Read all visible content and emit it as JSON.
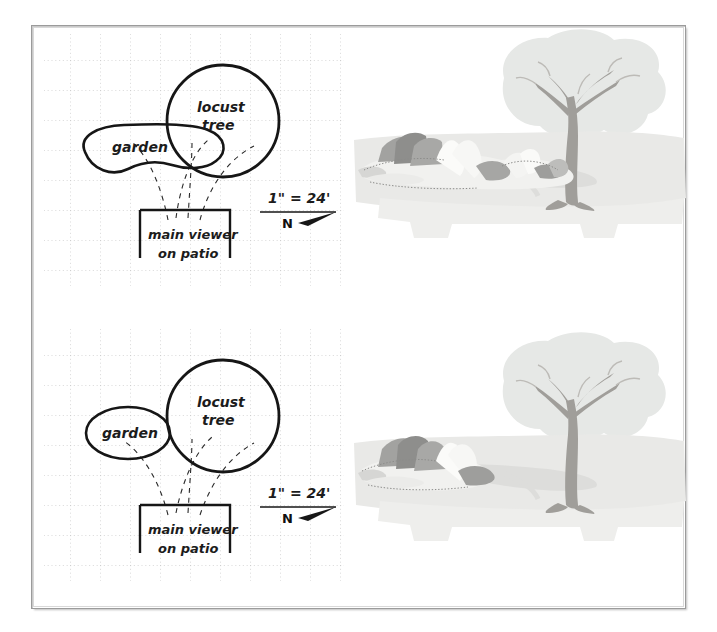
{
  "document": {
    "type": "landscape-design-study-sheet",
    "frame_color": "#9b9b9b",
    "paper_color": "#ffffff"
  },
  "studies": [
    {
      "id": "study-top",
      "variant": "large-garden",
      "plan": {
        "grid": {
          "style": "dotted",
          "color": "#b9b9b9",
          "spacing_px": 30
        },
        "shapes": [
          {
            "name": "garden-bed",
            "label": "garden",
            "kind": "freeform-blob",
            "size": "large"
          },
          {
            "name": "locust-tree-canopy",
            "label": "locust tree",
            "kind": "circle",
            "size": "large"
          },
          {
            "name": "viewer-patio",
            "label_line_1": "main viewer",
            "label_line_2": "on patio",
            "kind": "open-rectangle"
          }
        ],
        "sightlines": {
          "name": "view-cone",
          "style": "dashed",
          "count": 4
        },
        "scale": {
          "text": "1\" = 24'",
          "north_label": "N"
        }
      },
      "perspective": {
        "name": "perspective-view",
        "elements": [
          "sky-canopy",
          "lawn",
          "shadow",
          "locust-tree",
          "garden-planting",
          "patio-edge"
        ],
        "palette": {
          "canopy": "#e3e5e3",
          "lawn": "#e8e8e6",
          "shadow": "#dcdcda",
          "trunk": "#9c9a96",
          "plant-dark": "#9e9e9c",
          "plant-mid": "#c4c4c2",
          "plant-light": "#f2f2f0"
        },
        "garden_mass": "wide"
      }
    },
    {
      "id": "study-bottom",
      "variant": "small-garden",
      "plan": {
        "grid": {
          "style": "dotted",
          "color": "#b9b9b9",
          "spacing_px": 30
        },
        "shapes": [
          {
            "name": "garden-bed",
            "label": "garden",
            "kind": "ellipse",
            "size": "small"
          },
          {
            "name": "locust-tree-canopy",
            "label": "locust tree",
            "kind": "circle",
            "size": "large"
          },
          {
            "name": "viewer-patio",
            "label_line_1": "main viewer",
            "label_line_2": "on patio",
            "kind": "open-rectangle"
          }
        ],
        "sightlines": {
          "name": "view-cone",
          "style": "dashed",
          "count": 4
        },
        "scale": {
          "text": "1\" = 24'",
          "north_label": "N"
        }
      },
      "perspective": {
        "name": "perspective-view",
        "elements": [
          "sky-canopy",
          "lawn",
          "shadow",
          "locust-tree",
          "garden-planting",
          "patio-edge"
        ],
        "palette": {
          "canopy": "#e3e5e3",
          "lawn": "#e8e8e6",
          "shadow": "#dcdcda",
          "trunk": "#9c9a96",
          "plant-dark": "#9e9e9c",
          "plant-mid": "#c4c4c2",
          "plant-light": "#f2f2f0"
        },
        "garden_mass": "narrow"
      }
    }
  ]
}
